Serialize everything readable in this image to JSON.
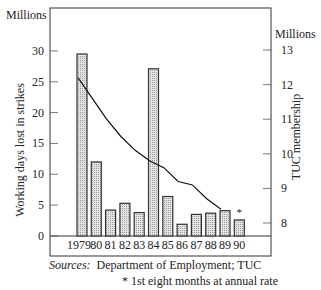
{
  "chart_data": {
    "type": "bar",
    "title": "",
    "categories": [
      "1979",
      "80",
      "81",
      "82",
      "83",
      "84",
      "85",
      "86",
      "87",
      "88",
      "89",
      "90"
    ],
    "series": [
      {
        "name": "Working days lost in strikes",
        "type": "bar",
        "axis": "left",
        "values": [
          29.5,
          12.0,
          4.2,
          5.3,
          3.8,
          27.1,
          6.4,
          1.9,
          3.5,
          3.7,
          4.1,
          2.6
        ]
      },
      {
        "name": "TUC membership",
        "type": "line",
        "axis": "right",
        "values": [
          12.2,
          11.6,
          11.0,
          10.5,
          10.1,
          9.8,
          9.6,
          9.2,
          9.1,
          8.7,
          8.4,
          null
        ]
      }
    ],
    "left_axis": {
      "label": "Working days lost in strikes",
      "unit": "Millions",
      "ticks": [
        0,
        5,
        10,
        15,
        20,
        25,
        30
      ],
      "ylim": [
        0,
        30
      ]
    },
    "right_axis": {
      "label": "TUC membership",
      "unit": "Millions",
      "ticks": [
        8,
        9,
        10,
        11,
        12,
        13
      ],
      "ylim": [
        7.6,
        13
      ]
    },
    "annotations": [
      {
        "category": "90",
        "text": "*"
      }
    ],
    "grid": false,
    "legend": "none"
  },
  "labels": {
    "left_unit": "Millions",
    "right_unit": "Millions",
    "left_axis_title": "Working days lost in strikes",
    "right_axis_title": "TUC membership",
    "sources_prefix": "Sources:",
    "sources_text": "Department of Employment; TUC",
    "footnote": "* 1st eight months at annual rate"
  },
  "style": {
    "bar_fill": "#cfcfcf",
    "bar_stroke": "#333333",
    "line_color": "#111111",
    "frame_color": "#333333"
  }
}
